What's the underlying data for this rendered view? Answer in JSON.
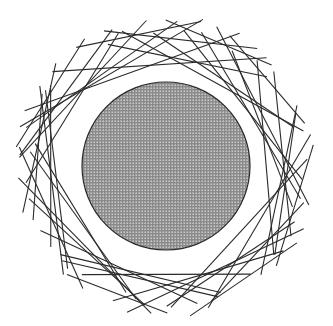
{
  "artwork": {
    "width": 333,
    "height": 326,
    "background": "#ffffff",
    "center": [
      166,
      166
    ],
    "disc": {
      "radius": 84,
      "fill": "#8a8a8a",
      "dot_color": "#d8d8d8",
      "stroke": "#2a2a2a"
    },
    "chords": {
      "count": 46,
      "stroke": "#2b2b2b",
      "stroke_width": 1.1,
      "outer_radius": 152,
      "inner_clearance": 96
    }
  }
}
